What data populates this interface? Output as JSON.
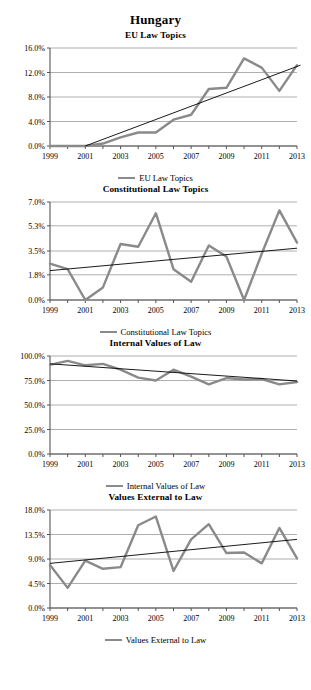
{
  "page": {
    "title": "Hungary"
  },
  "colors": {
    "series": "#8a8a8a",
    "trend": "#000000",
    "grid": "#9a9a9a",
    "axis": "#555555",
    "background": "#ffffff"
  },
  "charts": [
    {
      "id": "eu-law-topics",
      "title": "EU Law Topics",
      "legend_label": "EU Law Topics",
      "chart_data": {
        "type": "line",
        "title": "EU Law Topics",
        "xlabel": "",
        "ylabel": "",
        "grid": true,
        "legend_position": "bottom",
        "x": [
          1999,
          2000,
          2001,
          2002,
          2003,
          2004,
          2005,
          2006,
          2007,
          2008,
          2009,
          2010,
          2011,
          2012,
          2013
        ],
        "xticklabels": [
          "1999",
          "2001",
          "2003",
          "2005",
          "2007",
          "2009",
          "2011",
          "2013"
        ],
        "yticklabels": [
          "0.0%",
          "4.0%",
          "8.0%",
          "12.0%",
          "16.0%"
        ],
        "ylim": [
          0,
          16
        ],
        "yticks": [
          0,
          4,
          8,
          12,
          16
        ],
        "series": [
          {
            "name": "EU Law Topics",
            "values": [
              0.0,
              0.0,
              0.0,
              0.4,
              1.4,
              2.2,
              2.2,
              4.3,
              5.1,
              9.3,
              9.5,
              14.3,
              12.8,
              9.0,
              13.2
            ]
          },
          {
            "name": "Linear trend",
            "type": "trend",
            "values": [
              null,
              null,
              0.0,
              1.0,
              2.0,
              3.0,
              4.0,
              5.0,
              6.0,
              7.0,
              8.0,
              9.0,
              10.0,
              11.1,
              12.1
            ],
            "endpoints": [
              [
                2001,
                0.0
              ],
              [
                2013.2,
                13.2
              ]
            ]
          }
        ]
      }
    },
    {
      "id": "constitutional-law-topics",
      "title": "Constitutional Law Topics",
      "legend_label": "Constitutional Law Topics",
      "chart_data": {
        "type": "line",
        "title": "Constitutional Law Topics",
        "xlabel": "",
        "ylabel": "",
        "grid": true,
        "legend_position": "bottom",
        "x": [
          1999,
          2000,
          2001,
          2002,
          2003,
          2004,
          2005,
          2006,
          2007,
          2008,
          2009,
          2010,
          2011,
          2012,
          2013
        ],
        "xticklabels": [
          "1999",
          "2001",
          "2003",
          "2005",
          "2007",
          "2009",
          "2011",
          "2013"
        ],
        "yticklabels": [
          "0.0%",
          "1.8%",
          "3.5%",
          "5.3%",
          "7.0%"
        ],
        "ylim": [
          0,
          7.0
        ],
        "yticks": [
          0,
          1.8,
          3.5,
          5.3,
          7.0
        ],
        "series": [
          {
            "name": "Constitutional Law Topics",
            "values": [
              2.6,
              2.2,
              0.0,
              0.9,
              4.0,
              3.8,
              6.2,
              2.2,
              1.3,
              3.9,
              3.1,
              0.0,
              3.3,
              6.4,
              4.1
            ]
          },
          {
            "name": "Linear trend",
            "type": "trend",
            "endpoints": [
              [
                1999,
                2.1
              ],
              [
                2013,
                3.7
              ]
            ]
          }
        ]
      }
    },
    {
      "id": "internal-values-of-law",
      "title": "Internal Values of Law",
      "legend_label": "Internal Values of Law",
      "chart_data": {
        "type": "line",
        "title": "Internal Values of Law",
        "xlabel": "",
        "ylabel": "",
        "grid": true,
        "legend_position": "bottom",
        "x": [
          1999,
          2000,
          2001,
          2002,
          2003,
          2004,
          2005,
          2006,
          2007,
          2008,
          2009,
          2010,
          2011,
          2012,
          2013
        ],
        "xticklabels": [
          "1999",
          "2001",
          "2003",
          "2005",
          "2007",
          "2009",
          "2011",
          "2013"
        ],
        "yticklabels": [
          "0.0%",
          "25.0%",
          "50.0%",
          "75.0%",
          "100.0%"
        ],
        "ylim": [
          0,
          100
        ],
        "yticks": [
          0,
          25,
          50,
          75,
          100
        ],
        "series": [
          {
            "name": "Internal Values of Law",
            "values": [
              91.0,
              95.0,
              90.5,
              92.0,
              86.0,
              78.0,
              75.0,
              86.0,
              79.0,
              71.0,
              77.5,
              76.0,
              76.5,
              71.0,
              73.5
            ]
          },
          {
            "name": "Linear trend",
            "type": "trend",
            "endpoints": [
              [
                1999,
                92.0
              ],
              [
                2013,
                74.5
              ]
            ]
          }
        ]
      }
    },
    {
      "id": "values-external-to-law",
      "title": "Values External to Law",
      "legend_label": "Values External to Law",
      "chart_data": {
        "type": "line",
        "title": "Values External to Law",
        "xlabel": "",
        "ylabel": "",
        "grid": true,
        "legend_position": "bottom",
        "x": [
          1999,
          2000,
          2001,
          2002,
          2003,
          2004,
          2005,
          2006,
          2007,
          2008,
          2009,
          2010,
          2011,
          2012,
          2013
        ],
        "xticklabels": [
          "1999",
          "2001",
          "2003",
          "2005",
          "2007",
          "2009",
          "2011",
          "2013"
        ],
        "yticklabels": [
          "0.0%",
          "4.5%",
          "9.0%",
          "13.5%",
          "18.0%"
        ],
        "ylim": [
          0,
          18
        ],
        "yticks": [
          0,
          4.5,
          9.0,
          13.5,
          18.0
        ],
        "series": [
          {
            "name": "Values External to Law",
            "values": [
              7.9,
              3.7,
              8.7,
              7.2,
              7.5,
              15.2,
              16.8,
              6.8,
              12.6,
              15.4,
              10.1,
              10.2,
              8.2,
              14.7,
              9.1
            ]
          },
          {
            "name": "Linear trend",
            "type": "trend",
            "endpoints": [
              [
                1999,
                8.2
              ],
              [
                2013,
                12.6
              ]
            ]
          }
        ]
      }
    }
  ]
}
